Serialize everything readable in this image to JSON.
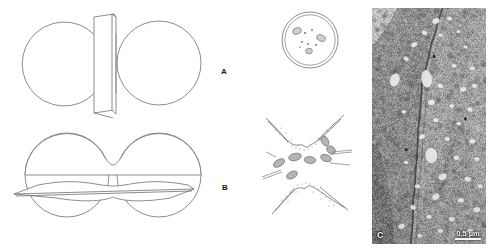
{
  "figure": {
    "width": 494,
    "height": 251,
    "background_color": "#ffffff",
    "line_color": "#6b6b6b",
    "type": "scientific-figure"
  },
  "panels": [
    {
      "id": "A",
      "label": "A",
      "label_x": 221,
      "label_y": 68,
      "schematic": {
        "name": "vertical-section-plane-through-paired-spheres",
        "left_sphere": {
          "cx": 67,
          "cy": 63,
          "r": 42
        },
        "right_sphere": {
          "cx": 159,
          "cy": 63,
          "r": 42
        },
        "section_plane": "vertical",
        "plane_top_y": 16,
        "plane_bottom_y": 118
      },
      "profile": {
        "name": "circular-cell-cross-section",
        "cx": 310,
        "cy": 40,
        "r": 28,
        "organelle_count": 9,
        "outline_style": "double-walled-circle"
      }
    },
    {
      "id": "B",
      "label": "B",
      "label_x": 222,
      "label_y": 184,
      "schematic": {
        "name": "horizontal-section-plane-through-paired-spheres",
        "left_sphere": {
          "cx": 67,
          "cy": 175,
          "r": 42
        },
        "right_sphere": {
          "cx": 159,
          "cy": 175,
          "r": 42
        },
        "section_plane": "horizontal",
        "plane_left_x": 14,
        "plane_right_x": 194
      },
      "profile": {
        "name": "stellate-cell-profile-with-organelles",
        "cx": 305,
        "cy": 165,
        "outline_style": "stellate-with-dotted-membrane",
        "organelle_count": 8,
        "rod_count": 4
      }
    },
    {
      "id": "C",
      "label": "C",
      "type": "electron-micrograph",
      "x": 372,
      "y": 8,
      "width": 114,
      "height": 236,
      "scalebar": {
        "text": "0.5 µm",
        "length_px": 26
      }
    }
  ]
}
